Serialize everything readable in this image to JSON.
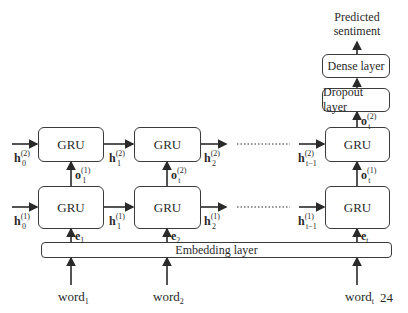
{
  "output": {
    "label_line1": "Predicted",
    "label_line2": "sentiment"
  },
  "layers": {
    "dense": "Dense layer",
    "dropout": "Dropout layer",
    "embedding": "Embedding layer",
    "gru": "GRU"
  },
  "hidden_states": {
    "top": [
      {
        "base": "h",
        "sub": "0",
        "sup": "(2)"
      },
      {
        "base": "h",
        "sub": "1",
        "sup": "(2)"
      },
      {
        "base": "h",
        "sub": "2",
        "sup": "(2)"
      },
      {
        "base": "h",
        "sub": "t−1",
        "sup": "(2)"
      }
    ],
    "bottom": [
      {
        "base": "h",
        "sub": "0",
        "sup": "(1)"
      },
      {
        "base": "h",
        "sub": "1",
        "sup": "(1)"
      },
      {
        "base": "h",
        "sub": "2",
        "sup": "(1)"
      },
      {
        "base": "h",
        "sub": "t−1",
        "sup": "(1)"
      }
    ]
  },
  "outputs_between": [
    {
      "base": "o",
      "sub": "1",
      "sup": "(1)"
    },
    {
      "base": "o",
      "sub": "t",
      "sup": "(2)"
    },
    {
      "base": "o",
      "sub": "t",
      "sup": "(1)"
    },
    {
      "base": "o",
      "sub": "t",
      "sup": "(2)"
    }
  ],
  "embeddings": [
    {
      "base": "e",
      "sub": "1"
    },
    {
      "base": "e",
      "sub": "2"
    },
    {
      "base": "e",
      "sub": "t"
    }
  ],
  "inputs": [
    {
      "base": "word",
      "sub": "1"
    },
    {
      "base": "word",
      "sub": "2"
    },
    {
      "base": "word",
      "sub": "t"
    }
  ],
  "page_number": "24",
  "colors": {
    "stroke": "#3a3a3a",
    "text": "#2a2a2a",
    "background": "#ffffff"
  }
}
